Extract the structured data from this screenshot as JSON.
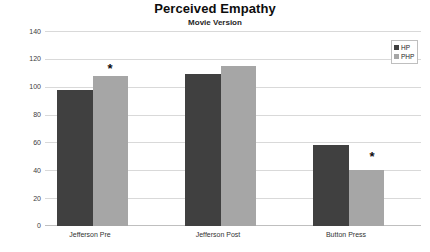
{
  "chart_data": {
    "type": "bar",
    "title": "Perceived Empathy",
    "subtitle": "Movie Version",
    "xlabel": "",
    "ylabel": "",
    "ylim": [
      0,
      140
    ],
    "yticks": [
      140,
      120,
      100,
      80,
      60,
      40,
      20,
      0
    ],
    "grid": true,
    "legend_position": "top-right",
    "categories": [
      "Jefferson Pre",
      "Jefferson Post",
      "Button Press"
    ],
    "series": [
      {
        "name": "HP",
        "color": "#404040",
        "values": [
          98,
          109,
          58
        ]
      },
      {
        "name": "PHP",
        "color": "#a6a6a6",
        "values": [
          108,
          115,
          40
        ]
      }
    ],
    "annotations": [
      {
        "symbol": "*",
        "category": "Jefferson Pre",
        "series": "PHP"
      },
      {
        "symbol": "*",
        "category": "Button Press",
        "series": "PHP"
      }
    ]
  },
  "legend": {
    "items": [
      {
        "label": "HP"
      },
      {
        "label": "PHP"
      }
    ]
  },
  "axis": {
    "y_tick_labels": [
      "140",
      "120",
      "100",
      "80",
      "60",
      "40",
      "20",
      "0"
    ],
    "x_tick_labels": [
      "Jefferson Pre",
      "Jefferson Post",
      "Button Press"
    ]
  }
}
